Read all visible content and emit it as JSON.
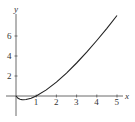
{
  "chart_data": {
    "type": "line",
    "title": "",
    "xlabel": "x",
    "ylabel": "y",
    "xlim": [
      -0.5,
      5.4
    ],
    "ylim": [
      -2.2,
      8.5
    ],
    "x_ticks": [
      1,
      2,
      3,
      4,
      5
    ],
    "y_ticks": [
      2,
      4,
      6
    ],
    "grid": false,
    "legend": null,
    "series": [
      {
        "name": "y = x ln x",
        "x": [
          0.0,
          0.1,
          0.2,
          0.3,
          0.368,
          0.5,
          0.75,
          1.0,
          1.5,
          2.0,
          2.5,
          3.0,
          3.5,
          4.0,
          4.5,
          5.0
        ],
        "values": [
          0.0,
          -0.23,
          -0.32,
          -0.36,
          -0.37,
          -0.35,
          -0.22,
          0.0,
          0.61,
          1.39,
          2.29,
          3.3,
          4.38,
          5.55,
          6.77,
          8.05
        ]
      }
    ],
    "colors": {
      "curve": "#222222",
      "axes": "#444444"
    }
  }
}
